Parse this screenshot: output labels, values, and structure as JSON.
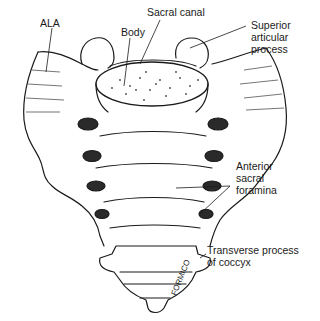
{
  "diagram": {
    "labels": {
      "ala": "ALA",
      "body": "Body",
      "sacral_canal": "Sacral canal",
      "superior_articular_process": "Superior\narticular\nprocess",
      "anterior_sacral_foramina": "Anterior\nsacral\nforamina",
      "transverse_process_coccyx": "Transverse process\nof coccyx"
    },
    "signature": "FORMICO",
    "colors": {
      "line": "#1a1a1a",
      "background": "#ffffff",
      "stipple": "#444444"
    }
  }
}
